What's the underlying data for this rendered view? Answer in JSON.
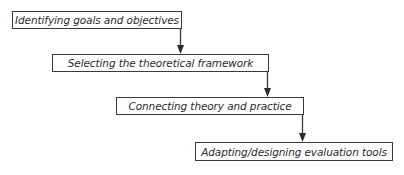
{
  "diagram": {
    "type": "stepped-flowchart",
    "direction": "top-left to bottom-right",
    "steps": [
      {
        "label": "Identifying goals and objectives"
      },
      {
        "label": "Selecting the theoretical framework"
      },
      {
        "label": "Connecting theory and practice"
      },
      {
        "label": "Adapting/designing evaluation tools"
      }
    ],
    "connectors": [
      {
        "from": 0,
        "to": 1,
        "icon": "arrow-down-icon"
      },
      {
        "from": 1,
        "to": 2,
        "icon": "arrow-down-icon"
      },
      {
        "from": 2,
        "to": 3,
        "icon": "arrow-down-icon"
      }
    ],
    "colors": {
      "border": "#3a3a3a",
      "text": "#2b2b2b",
      "background": "#ffffff"
    }
  }
}
